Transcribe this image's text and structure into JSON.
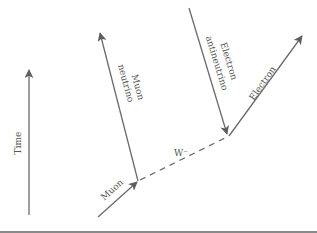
{
  "diagram": {
    "type": "feynman",
    "colors": {
      "line": "#6b6b6b",
      "text": "#555555",
      "rule": "#8a8a8a"
    },
    "labels": {
      "time": "Time",
      "muon": "Muon",
      "muon_neutrino_1": "Muon",
      "muon_neutrino_2": "neutrino",
      "electron_antineutrino_1": "Electron",
      "electron_antineutrino_2": "antineutrino",
      "electron": "Electron",
      "w_boson": "W⁻"
    },
    "particles": [
      {
        "name": "Muon",
        "direction": "incoming"
      },
      {
        "name": "Muon neutrino",
        "direction": "outgoing"
      },
      {
        "name": "Electron antineutrino",
        "direction": "incoming"
      },
      {
        "name": "Electron",
        "direction": "outgoing"
      }
    ],
    "propagator": "W⁻",
    "axis": "Time"
  }
}
